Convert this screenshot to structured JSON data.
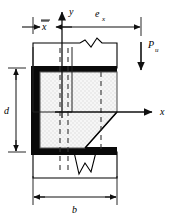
{
  "figure": {
    "type": "engineering-cross-section"
  },
  "axes": {
    "x_label": "x",
    "y_label": "y"
  },
  "dimensions": {
    "x_bar": "x",
    "x_bar_overbar": true,
    "e_x_base": "e",
    "e_x_sub": "x",
    "d": "d",
    "b": "b"
  },
  "load": {
    "base": "P",
    "sub": "u",
    "direction": "down"
  },
  "colors": {
    "outline": "#000000",
    "weld_black": "#0a0a0a",
    "plate_fill": "#e8e8e8",
    "plate_edge": "#555555",
    "dim_line": "#1a1a1a"
  },
  "geometry": {
    "plate_left": 33,
    "plate_right": 117,
    "plate_top": 65,
    "plate_bottom": 155,
    "chamfer_start_x": 117,
    "chamfer_start_y": 112,
    "chamfer_end_x": 85,
    "chamfer_end_y": 152,
    "axis_origin_x": 62,
    "axis_origin_y": 112,
    "load_x": 141,
    "dashed_lines": [
      60,
      68,
      101
    ]
  }
}
